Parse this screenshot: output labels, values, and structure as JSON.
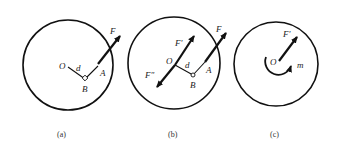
{
  "figure": {
    "panels": [
      {
        "id": "a",
        "caption": "(a)",
        "labels": {
          "O": "O",
          "d": "d",
          "A": "A",
          "B": "B",
          "F": "F"
        }
      },
      {
        "id": "b",
        "caption": "(b)",
        "labels": {
          "O": "O",
          "d": "d",
          "A": "A",
          "B": "B",
          "F": "F",
          "F_prime": "F'",
          "F_double_prime": "F\""
        }
      },
      {
        "id": "c",
        "caption": "(c)",
        "labels": {
          "O": "O",
          "F_prime": "F'",
          "m": "m"
        }
      }
    ],
    "colors": {
      "stroke": "#111111",
      "background": "#ffffff"
    }
  }
}
